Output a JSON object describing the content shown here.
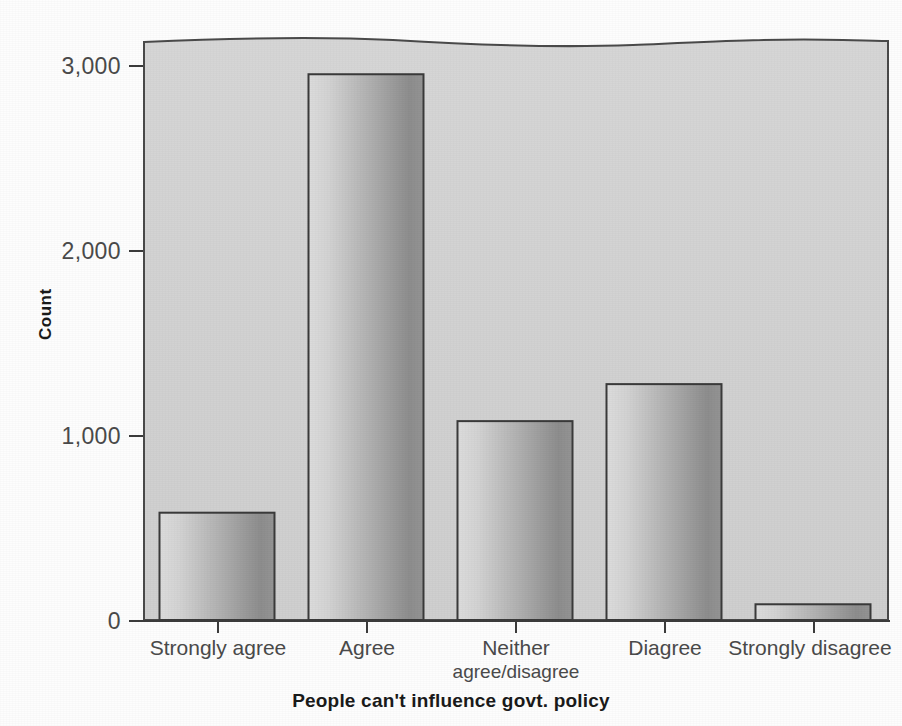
{
  "chart_data": {
    "type": "bar",
    "title": "",
    "subtitle": "",
    "xlabel": "People can't influence govt. policy",
    "ylabel": "Count",
    "categories": [
      "Strongly agree",
      "Agree",
      "Neither agree/disagree",
      "Diagree",
      "Strongly disagree"
    ],
    "category_lines": [
      [
        "Strongly agree"
      ],
      [
        "Agree"
      ],
      [
        "Neither",
        "agree/disagree"
      ],
      [
        "Diagree"
      ],
      [
        "Strongly disagree"
      ]
    ],
    "values": [
      580,
      2950,
      1075,
      1275,
      85
    ],
    "ylim": [
      0,
      3150
    ],
    "yticks": [
      0,
      1000,
      2000,
      3000
    ],
    "ytick_labels": [
      "0",
      "1,000",
      "2,000",
      "3,000"
    ],
    "grid": false,
    "legend": null,
    "colors": {
      "panel_background": "#d2d2d2",
      "bar_gradient_light": "#d8d8d8",
      "bar_gradient_dark": "#8d8d8d",
      "bar_outline": "#3a3a3a",
      "axis": "#3b3b3b",
      "tick_text": "#4a4a4a",
      "title_text": "#1a1a1a",
      "page_background": "#fdfdfd"
    }
  },
  "axes": {
    "y": {
      "title": "Count",
      "ticks": [
        {
          "label": "3,000",
          "value": 3000
        },
        {
          "label": "2,000",
          "value": 2000
        },
        {
          "label": "1,000",
          "value": 1000
        },
        {
          "label": "0",
          "value": 0
        }
      ]
    },
    "x": {
      "title": "People can't influence govt. policy",
      "ticks": [
        {
          "line1": "Strongly agree",
          "line2": ""
        },
        {
          "line1": "Agree",
          "line2": ""
        },
        {
          "line1": "Neither",
          "line2": "agree/disagree"
        },
        {
          "line1": "Diagree",
          "line2": ""
        },
        {
          "line1": "Strongly disagree",
          "line2": ""
        }
      ]
    }
  }
}
